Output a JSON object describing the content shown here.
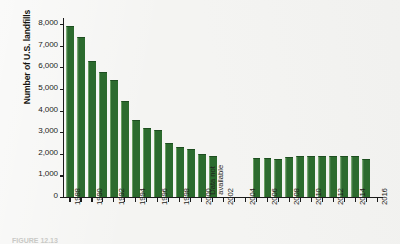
{
  "figure": {
    "caption": "FIGURE 12.13"
  },
  "chart_data": {
    "type": "bar",
    "title": "",
    "xlabel": "",
    "ylabel": "Number of U.S. landfills",
    "ylim": [
      0,
      8000
    ],
    "ytick_values": [
      0,
      1000,
      2000,
      3000,
      4000,
      5000,
      6000,
      7000,
      8000
    ],
    "ytick_labels": [
      "0",
      "1,000",
      "2,000",
      "3,000",
      "4,000",
      "5,000",
      "6,000",
      "7,000",
      "8,000"
    ],
    "xlim": [
      1987.4,
      2016.6
    ],
    "xtick_values": [
      1988,
      1989,
      1990,
      1991,
      1992,
      1993,
      1994,
      1995,
      1996,
      1997,
      1998,
      1999,
      2000,
      2001,
      2002,
      2003,
      2004,
      2005,
      2006,
      2007,
      2008,
      2009,
      2010,
      2011,
      2012,
      2013,
      2014,
      2015,
      2016
    ],
    "xtick_labels": [
      "1988",
      "",
      "1990",
      "",
      "1992",
      "",
      "1994",
      "",
      "1996",
      "",
      "1998",
      "",
      "2000",
      "",
      "2002",
      "",
      "2004",
      "",
      "2006",
      "",
      "2008",
      "",
      "2010",
      "",
      "2012",
      "",
      "2014",
      "",
      "2016"
    ],
    "grid": false,
    "legend": false,
    "bar_color": "#2c6b2e",
    "bar_edge_color": "#5a9452",
    "categories": [
      1988,
      1989,
      1990,
      1991,
      1992,
      1993,
      1994,
      1995,
      1996,
      1997,
      1998,
      1999,
      2000,
      2001,
      2002,
      2003,
      2004,
      2005,
      2006,
      2007,
      2008,
      2009,
      2010,
      2011,
      2012,
      2013,
      2014,
      2015
    ],
    "values": [
      7900,
      7400,
      6300,
      5800,
      5400,
      4450,
      3550,
      3200,
      3100,
      2500,
      2300,
      2200,
      2000,
      1900,
      null,
      null,
      null,
      1800,
      1790,
      1780,
      1830,
      1880,
      1900,
      1900,
      1900,
      1900,
      1900,
      1750
    ],
    "annotations": [
      {
        "text_lines": [
          "Data not",
          "available"
        ],
        "x_range": [
          2002,
          2004
        ],
        "rotation": 90
      }
    ]
  }
}
